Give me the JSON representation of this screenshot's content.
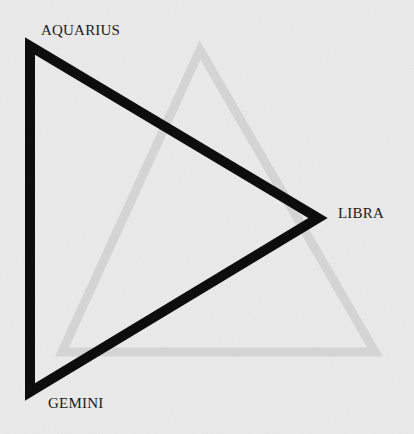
{
  "diagram": {
    "type": "triangle",
    "vertices": [
      {
        "label": "AQUARIUS",
        "x": 30,
        "y": 46
      },
      {
        "label": "LIBRA",
        "x": 318,
        "y": 218
      },
      {
        "label": "GEMINI",
        "x": 30,
        "y": 392
      }
    ],
    "stroke_color": "#0d0d0d",
    "background_color": "#ececec",
    "faint_background_triangle": {
      "apex": [
        200,
        50
      ],
      "base_left": [
        62,
        352
      ],
      "base_right": [
        375,
        352
      ],
      "color": "#d6d6d6"
    }
  },
  "labels": {
    "aquarius": "AQUARIUS",
    "libra": "LIBRA",
    "gemini": "GEMINI"
  }
}
